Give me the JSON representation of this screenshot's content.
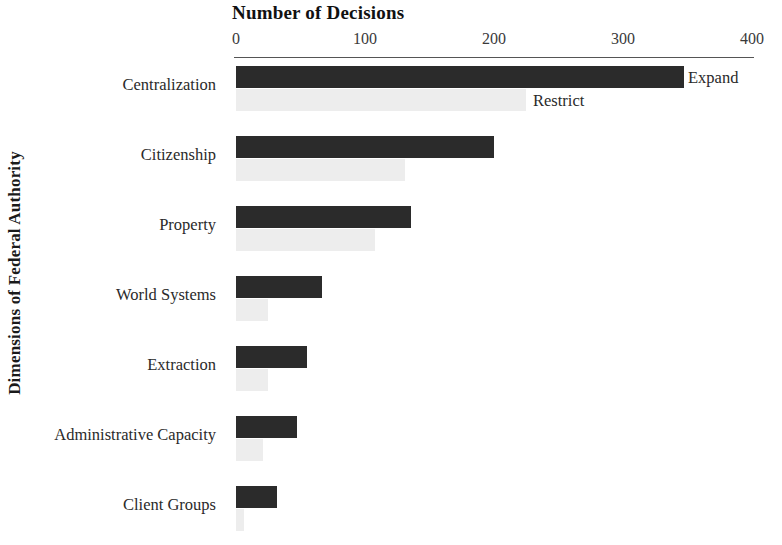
{
  "chart_data": {
    "type": "bar",
    "orientation": "horizontal",
    "title": "Number of Decisions",
    "xlabel": "Number of Decisions",
    "ylabel": "Dimensions of Federal Authority",
    "categories": [
      "Centralization",
      "Citizenship",
      "Property",
      "World Systems",
      "Extraction",
      "Administrative Capacity",
      "Client Groups"
    ],
    "series": [
      {
        "name": "Expand",
        "color": "#2b2b2b",
        "values": [
          347,
          200,
          136,
          67,
          55,
          47,
          32
        ]
      },
      {
        "name": "Restrict",
        "color": "#ededed",
        "values": [
          225,
          131,
          108,
          25,
          25,
          21,
          6
        ]
      }
    ],
    "xlim": [
      0,
      400
    ],
    "xticks": [
      0,
      100,
      200,
      300,
      400
    ],
    "xtick_labels": [
      "0",
      "100",
      "200",
      "300",
      "400"
    ],
    "grid": false,
    "legend": {
      "position": "inline-first-group",
      "entries": [
        "Expand",
        "Restrict"
      ]
    },
    "axis_line_color": "#555555",
    "background": "#ffffff"
  }
}
